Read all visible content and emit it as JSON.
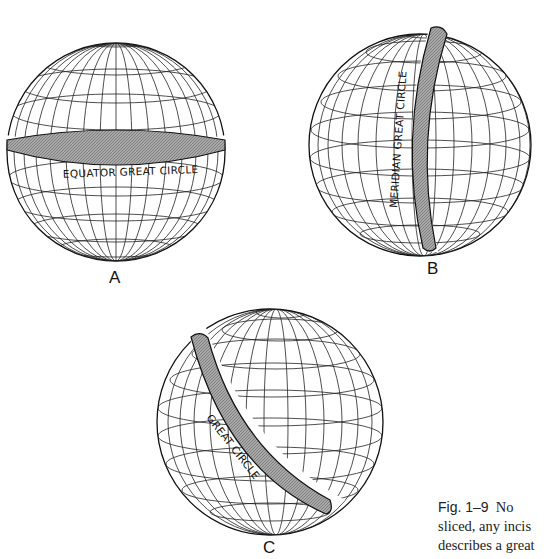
{
  "figure": {
    "globes": [
      {
        "id": "A",
        "letter": "A",
        "band_label": "EQUATOR   GREAT CIRCLE",
        "band_type": "equator"
      },
      {
        "id": "B",
        "letter": "B",
        "band_label": "MERIDIAN   GREAT CIRCLE",
        "band_type": "meridian"
      },
      {
        "id": "C",
        "letter": "C",
        "band_label": "GREAT CIRCLE",
        "band_type": "oblique"
      }
    ],
    "caption": {
      "fig_number": "Fig. 1–9",
      "line1_rest": "No",
      "line2": "sliced, any incis",
      "line3": "describes a great"
    },
    "colors": {
      "band_fill": "#9a9a9a",
      "line": "#111111",
      "background": "#ffffff"
    }
  }
}
